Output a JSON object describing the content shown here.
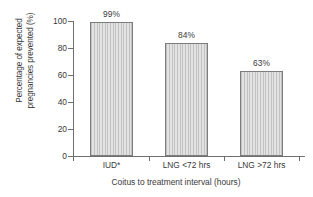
{
  "chart_data": {
    "type": "bar",
    "title": "",
    "xlabel": "Coitus to treatment interval (hours)",
    "ylabel": "Percentage of expected pregnancies prevented (%)",
    "ylabel_line1": "Percentage of expected",
    "ylabel_line2": "pregnancies prevented (%)",
    "categories": [
      "IUD*",
      "LNG <72 hrs",
      "LNG >72 hrs"
    ],
    "values": [
      99,
      84,
      63
    ],
    "value_labels": [
      "99%",
      "84%",
      "63%"
    ],
    "ylim": [
      0,
      100
    ],
    "yticks": [
      0,
      20,
      40,
      60,
      80,
      100
    ],
    "ytick_labels": [
      "0",
      "20",
      "40",
      "60",
      "80",
      "100"
    ],
    "grid": false,
    "legend": false,
    "bar_fill_color": "#d3d3d3",
    "bar_border_color": "#7d7d7d",
    "axis_color": "#6f6f6f",
    "text_color": "#3a3a3a",
    "background_color": "#ffffff"
  }
}
